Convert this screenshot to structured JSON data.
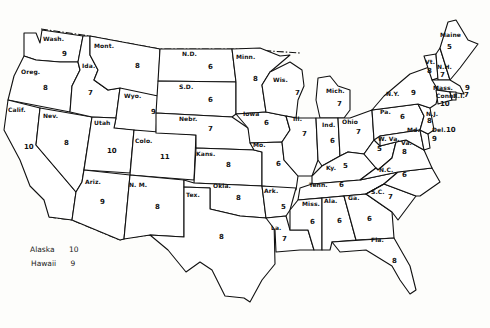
{
  "map": {
    "type": "us-state-choropleth-values",
    "states": [
      {
        "abbr": "Wash.",
        "value": "9"
      },
      {
        "abbr": "Oreg.",
        "value": "8"
      },
      {
        "abbr": "Calif.",
        "value": "10"
      },
      {
        "abbr": "Nev.",
        "value": "8"
      },
      {
        "abbr": "Ida.",
        "value": "7"
      },
      {
        "abbr": "Mont.",
        "value": "8"
      },
      {
        "abbr": "Wyo.",
        "value": "9"
      },
      {
        "abbr": "Utah",
        "value": "10"
      },
      {
        "abbr": "Colo.",
        "value": "11"
      },
      {
        "abbr": "Ariz.",
        "value": "9"
      },
      {
        "abbr": "N. M.",
        "value": "8"
      },
      {
        "abbr": "N.D.",
        "value": "6"
      },
      {
        "abbr": "S.D.",
        "value": "6"
      },
      {
        "abbr": "Nebr.",
        "value": "7"
      },
      {
        "abbr": "Kans.",
        "value": "8"
      },
      {
        "abbr": "Okla.",
        "value": "8"
      },
      {
        "abbr": "Tex.",
        "value": "8"
      },
      {
        "abbr": "Minn.",
        "value": "8"
      },
      {
        "abbr": "Iowa",
        "value": "6"
      },
      {
        "abbr": "Mo.",
        "value": "6"
      },
      {
        "abbr": "Ark.",
        "value": "5"
      },
      {
        "abbr": "La.",
        "value": "7"
      },
      {
        "abbr": "Wis.",
        "value": "7"
      },
      {
        "abbr": "Ill.",
        "value": "7"
      },
      {
        "abbr": "Mich.",
        "value": "7"
      },
      {
        "abbr": "Ind.",
        "value": "6"
      },
      {
        "abbr": "Ohio",
        "value": "7"
      },
      {
        "abbr": "Ky.",
        "value": "5"
      },
      {
        "abbr": "Tenn.",
        "value": "6"
      },
      {
        "abbr": "Miss.",
        "value": "6"
      },
      {
        "abbr": "Ala.",
        "value": "6"
      },
      {
        "abbr": "Ga.",
        "value": "6"
      },
      {
        "abbr": "Fla.",
        "value": "8"
      },
      {
        "abbr": "N.Y.",
        "value": "9"
      },
      {
        "abbr": "Pa.",
        "value": "6"
      },
      {
        "abbr": "W. Va.",
        "value": "5"
      },
      {
        "abbr": "Va.",
        "value": "8"
      },
      {
        "abbr": "N.C.",
        "value": "6"
      },
      {
        "abbr": "S.C.",
        "value": "7"
      },
      {
        "abbr": "Maine",
        "value": "5"
      },
      {
        "abbr": "Vt.",
        "value": "8"
      },
      {
        "abbr": "N.H.",
        "value": "7"
      },
      {
        "abbr": "Mass.",
        "value": "9"
      },
      {
        "abbr": "R.I.",
        "value": "7"
      },
      {
        "abbr": "Conn.",
        "value": "10"
      },
      {
        "abbr": "N.J.",
        "value": "8"
      },
      {
        "abbr": "Del.",
        "value": "10"
      },
      {
        "abbr": "Md.",
        "value": "9"
      }
    ],
    "inset_legend": [
      {
        "name": "Alaska",
        "value": "10"
      },
      {
        "name": "Hawaii",
        "value": "9"
      }
    ]
  }
}
